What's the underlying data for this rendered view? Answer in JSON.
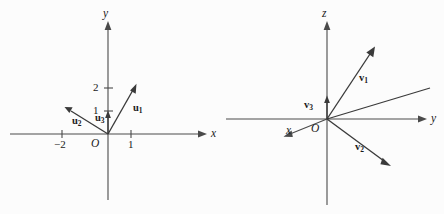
{
  "figure": {
    "background_color": "#fcfcfc",
    "axis_color": "#4a4a4a",
    "vector_color": "#3a3a3a",
    "width": 444,
    "height": 214
  },
  "left_plot": {
    "name": "two-dimensional-vector-plot",
    "origin_label": "O",
    "axes": [
      {
        "name": "x-axis",
        "label": "x",
        "direction": "horizontal-right"
      },
      {
        "name": "y-axis",
        "label": "y",
        "direction": "vertical-up"
      }
    ],
    "x_ticks": [
      {
        "label": "−2",
        "value": -2
      },
      {
        "label": "1",
        "value": 1
      }
    ],
    "y_ticks": [
      {
        "label": "1",
        "value": 1
      },
      {
        "label": "2",
        "value": 2
      }
    ],
    "vectors": [
      {
        "name": "u1",
        "label": "u",
        "subscript": "1",
        "components": [
          1,
          2
        ],
        "arrowhead": true
      },
      {
        "name": "u2",
        "label": "u",
        "subscript": "2",
        "components": [
          -2,
          1
        ],
        "arrowhead": true
      },
      {
        "name": "u3",
        "label": "u",
        "subscript": "3",
        "components": [
          0,
          1
        ],
        "arrowhead": true
      }
    ]
  },
  "right_plot": {
    "name": "three-dimensional-vector-plot",
    "origin_label": "O",
    "axes": [
      {
        "name": "x-axis",
        "label": "x",
        "direction": "oblique-down-left"
      },
      {
        "name": "y-axis",
        "label": "y",
        "direction": "horizontal-right"
      },
      {
        "name": "z-axis",
        "label": "z",
        "direction": "vertical-up"
      }
    ],
    "vectors": [
      {
        "name": "v1",
        "label": "v",
        "subscript": "1",
        "direction": "up-right",
        "arrowhead": true
      },
      {
        "name": "v2",
        "label": "v",
        "subscript": "2",
        "direction": "down-right",
        "arrowhead": true
      },
      {
        "name": "v3",
        "label": "v",
        "subscript": "3",
        "direction": "vertical-up-short",
        "arrowhead": true
      }
    ],
    "unlabeled_ray": {
      "name": "unlabeled-ray",
      "direction": "up-right-shallow",
      "arrowhead": false
    }
  }
}
